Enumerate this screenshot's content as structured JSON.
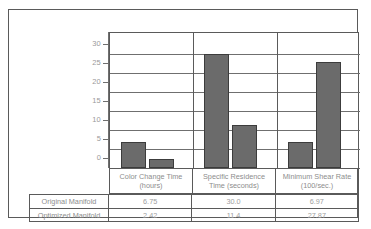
{
  "chart_data": {
    "type": "bar",
    "title": "",
    "xlabel": "",
    "ylabel": "",
    "ylim": [
      0,
      30
    ],
    "grid": true,
    "legend_position": "none",
    "categories": [
      "Color Change Time (hours)",
      "Specific Residence Time (seconds)",
      "Minimum Shear Rate (100/sec.)"
    ],
    "category_lines": [
      [
        "Color Change Time",
        "(hours)"
      ],
      [
        "Specific Residence",
        "Time (seconds)"
      ],
      [
        "Minimum Shear Rate",
        "(100/sec.)"
      ]
    ],
    "yticks": [
      0,
      5,
      10,
      15,
      20,
      25,
      30
    ],
    "ytick_labels": [
      "0",
      "5",
      "10",
      "15",
      "20",
      "25",
      "30"
    ],
    "series": [
      {
        "name": "Original Manifold",
        "values": [
          6.75,
          30.0,
          6.97
        ],
        "display": [
          "6.75",
          "30.0",
          "6.97"
        ]
      },
      {
        "name": "Optimized Manifold",
        "values": [
          2.42,
          11.4,
          27.87
        ],
        "display": [
          "2.42",
          "11.4",
          "27.87"
        ]
      }
    ],
    "bar_color": "#6b6b6b",
    "bar_edge_color": "#3c3c3c",
    "grid_color": "#6f6f6f"
  },
  "table": {
    "rows": [
      {
        "label": "Original Manifold",
        "cells": [
          "6.75",
          "30.0",
          "6.97"
        ]
      },
      {
        "label": "Optimized Manifold",
        "cells": [
          "2.42",
          "11.4",
          "27.87"
        ]
      }
    ]
  }
}
